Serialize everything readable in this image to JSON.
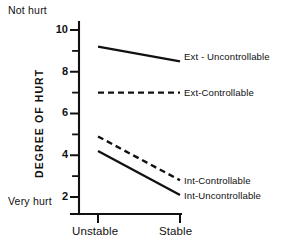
{
  "chart_data": {
    "type": "line",
    "title": "",
    "xlabel": "",
    "ylabel": "DEGREE OF HURT",
    "categories": [
      "Unstable",
      "Stable"
    ],
    "x": [
      0,
      1
    ],
    "ylim": [
      1,
      10.8
    ],
    "yticks": [
      2,
      4,
      6,
      8,
      10
    ],
    "ytick_labels": [
      "2",
      "4",
      "6",
      "8",
      "10"
    ],
    "minor_yticks": [
      3,
      5,
      7,
      9
    ],
    "grid": false,
    "legend_position": "inline-right",
    "axis_anchor_high": "Not hurt",
    "axis_anchor_low": "Very hurt",
    "series": [
      {
        "name": "Ext - Uncontrollable",
        "style": "solid",
        "values": [
          9.2,
          8.5
        ]
      },
      {
        "name": "Ext-Controllable",
        "style": "dashed",
        "values": [
          7.0,
          7.0
        ]
      },
      {
        "name": "Int-Controllable",
        "style": "dashed",
        "values": [
          4.9,
          2.8
        ]
      },
      {
        "name": "Int-Uncontrollable",
        "style": "solid",
        "values": [
          4.2,
          2.1
        ]
      }
    ]
  },
  "labels": {
    "not_hurt": "Not hurt",
    "very_hurt": "Very hurt",
    "y_axis_title": "DEGREE OF HURT",
    "tick_10": "10",
    "tick_8": "8",
    "tick_6": "6",
    "tick_4": "4",
    "tick_2": "2",
    "cat_unstable": "Unstable",
    "cat_stable": "Stable",
    "series_ext_uncontrollable": "Ext - Uncontrollable",
    "series_ext_controllable": "Ext-Controllable",
    "series_int_controllable": "Int-Controllable",
    "series_int_uncontrollable": "Int-Uncontrollable"
  },
  "colors": {
    "ink": "#111111",
    "background": "#ffffff"
  }
}
